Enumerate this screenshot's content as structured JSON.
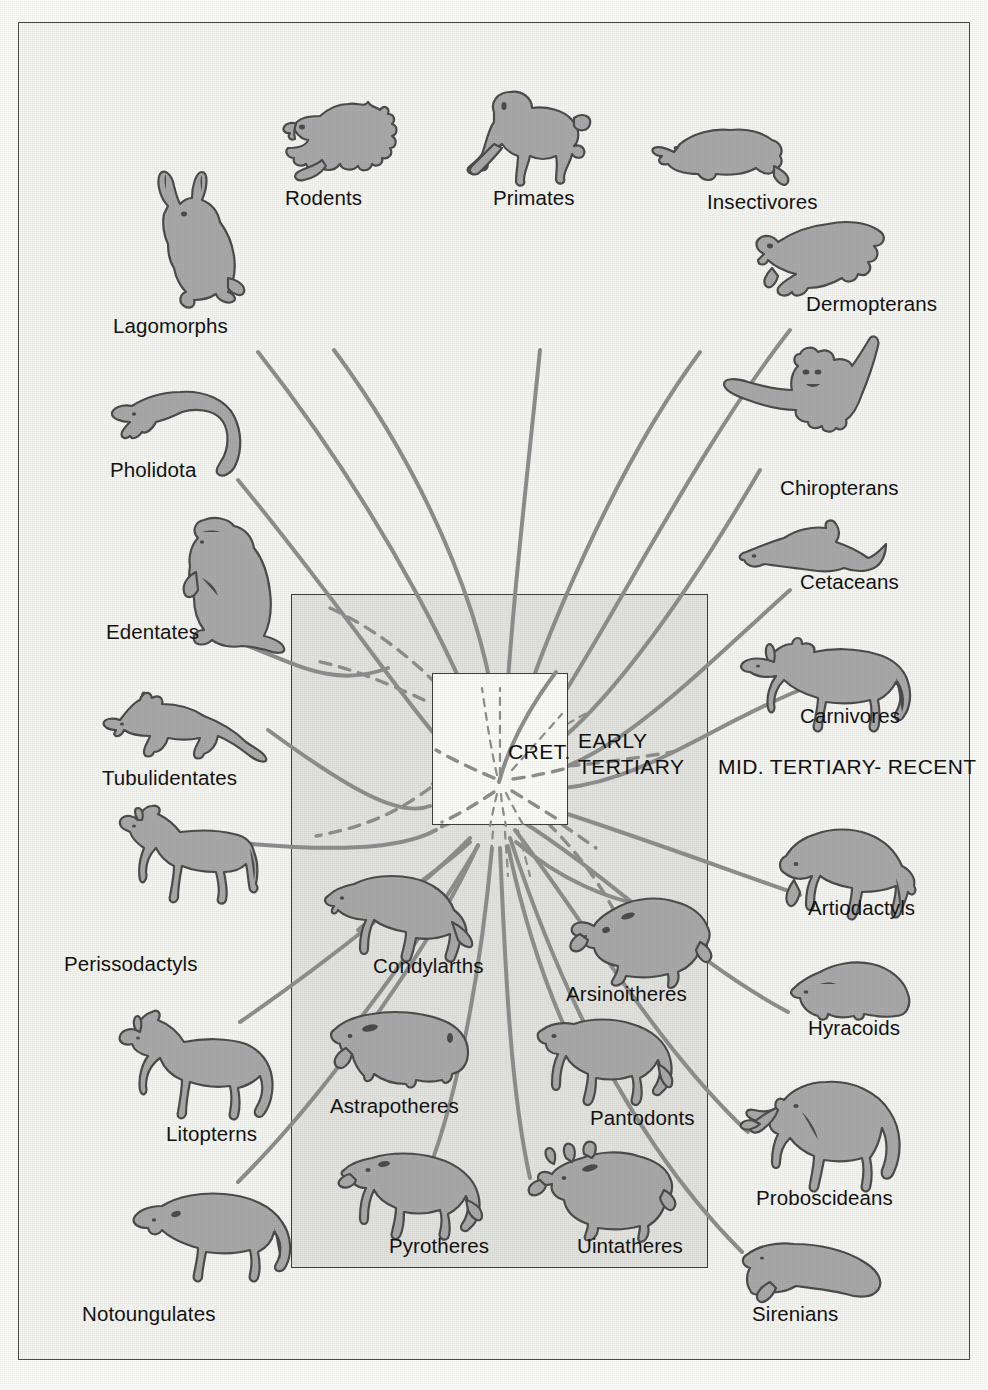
{
  "figure": {
    "background_color": "#f4f4f1",
    "silhouette_fill": "#a9a9a9",
    "silhouette_stroke": "#4c4c4c",
    "line_color": "#8e8e8e",
    "frame_color": "#4a4a4a",
    "center_box_fill": "#e2e2de",
    "cret_box_fill": "#fbfbf8"
  },
  "era_labels": {
    "cretaceous": "CRET.",
    "early_tertiary_line1": "EARLY",
    "early_tertiary_line2": "TERTIARY",
    "mid_tertiary_recent": "MID. TERTIARY- RECENT"
  },
  "taxa": [
    {
      "id": "rodents",
      "label": "Rodents",
      "icon": "squirrel-icon",
      "group": "top",
      "region": "mid-tertiary-recent"
    },
    {
      "id": "primates",
      "label": "Primates",
      "icon": "monkey-icon",
      "group": "top",
      "region": "mid-tertiary-recent"
    },
    {
      "id": "insectivores",
      "label": "Insectivores",
      "icon": "shrew-icon",
      "group": "top",
      "region": "mid-tertiary-recent"
    },
    {
      "id": "lagomorphs",
      "label": "Lagomorphs",
      "icon": "rabbit-icon",
      "group": "left",
      "region": "mid-tertiary-recent"
    },
    {
      "id": "pholidota",
      "label": "Pholidota",
      "icon": "pangolin-icon",
      "group": "left",
      "region": "mid-tertiary-recent"
    },
    {
      "id": "edentates",
      "label": "Edentates",
      "icon": "sloth-icon",
      "group": "left",
      "region": "mid-tertiary-recent"
    },
    {
      "id": "tubulidentates",
      "label": "Tubulidentates",
      "icon": "aardvark-icon",
      "group": "left",
      "region": "mid-tertiary-recent"
    },
    {
      "id": "perissodactyls",
      "label": "Perissodactyls",
      "icon": "horse-icon",
      "group": "left",
      "region": "mid-tertiary-recent"
    },
    {
      "id": "litopterns",
      "label": "Litopterns",
      "icon": "litoptern-icon",
      "group": "left",
      "region": "mid-tertiary-recent"
    },
    {
      "id": "notoungulates",
      "label": "Notoungulates",
      "icon": "notoungulate-icon",
      "group": "left",
      "region": "mid-tertiary-recent"
    },
    {
      "id": "dermopterans",
      "label": "Dermopterans",
      "icon": "colugo-icon",
      "group": "right",
      "region": "mid-tertiary-recent"
    },
    {
      "id": "chiropterans",
      "label": "Chiropterans",
      "icon": "bat-icon",
      "group": "right",
      "region": "mid-tertiary-recent"
    },
    {
      "id": "cetaceans",
      "label": "Cetaceans",
      "icon": "dolphin-icon",
      "group": "right",
      "region": "mid-tertiary-recent"
    },
    {
      "id": "carnivores",
      "label": "Carnivores",
      "icon": "wolf-icon",
      "group": "right",
      "region": "mid-tertiary-recent"
    },
    {
      "id": "artiodactyls",
      "label": "Artiodactyls",
      "icon": "bison-icon",
      "group": "right",
      "region": "mid-tertiary-recent"
    },
    {
      "id": "hyracoids",
      "label": "Hyracoids",
      "icon": "hyrax-icon",
      "group": "right",
      "region": "mid-tertiary-recent"
    },
    {
      "id": "proboscideans",
      "label": "Proboscideans",
      "icon": "elephant-icon",
      "group": "right",
      "region": "mid-tertiary-recent"
    },
    {
      "id": "sirenians",
      "label": "Sirenians",
      "icon": "manatee-icon",
      "group": "right",
      "region": "mid-tertiary-recent"
    },
    {
      "id": "condylarths",
      "label": "Condylarths",
      "icon": "condylarth-icon",
      "group": "box",
      "region": "early-tertiary"
    },
    {
      "id": "arsinoitheres",
      "label": "Arsinoitheres",
      "icon": "arsinoithere-icon",
      "group": "box",
      "region": "early-tertiary"
    },
    {
      "id": "astrapotheres",
      "label": "Astrapotheres",
      "icon": "astrapothere-icon",
      "group": "box",
      "region": "early-tertiary"
    },
    {
      "id": "pantodonts",
      "label": "Pantodonts",
      "icon": "pantodont-icon",
      "group": "box",
      "region": "early-tertiary"
    },
    {
      "id": "pyrotheres",
      "label": "Pyrotheres",
      "icon": "pyrothere-icon",
      "group": "box",
      "region": "early-tertiary"
    },
    {
      "id": "uintatheres",
      "label": "Uintatheres",
      "icon": "uintathere-icon",
      "group": "box",
      "region": "early-tertiary"
    }
  ]
}
